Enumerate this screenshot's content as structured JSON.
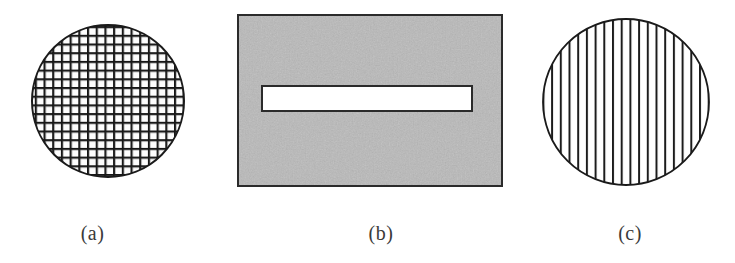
{
  "figure": {
    "panels": [
      {
        "id": "a",
        "caption": "(a)",
        "shape": "circle",
        "fill_pattern": "cross-hatch-mesh",
        "description": "Circular disc filled with a fine square woven mesh grid",
        "circle": {
          "cx": 108,
          "cy": 101,
          "r": 76
        },
        "pattern": {
          "spacing_px": 8.7,
          "line_width_px": 2.2,
          "orientation": "both"
        },
        "outline_color": "#1a1a1a",
        "line_color": "#262626",
        "background_color": "#ffffff"
      },
      {
        "id": "b",
        "caption": "(b)",
        "shape": "rectangle",
        "fill_pattern": "speckled-gray-noise",
        "description": "Gray textured rectangular plate with a long horizontal white slot",
        "rect": {
          "x": 10,
          "y": 15,
          "width": 264,
          "height": 171
        },
        "slot": {
          "x": 34,
          "y": 86,
          "width": 210,
          "height": 25
        },
        "fill_color": "#b9b9b9",
        "slot_fill_color": "#ffffff",
        "outline_color": "#2b2b2b"
      },
      {
        "id": "c",
        "caption": "(c)",
        "shape": "circle",
        "fill_pattern": "vertical-stripes",
        "description": "Circular disc filled with evenly spaced vertical line stripes",
        "circle": {
          "cx": 101,
          "cy": 102,
          "r": 83
        },
        "pattern": {
          "spacing_px": 8.7,
          "line_width_px": 2.0,
          "orientation": "vertical",
          "count": 19
        },
        "outline_color": "#1a1a1a",
        "line_color": "#1f1f1f",
        "background_color": "#ffffff"
      }
    ]
  }
}
